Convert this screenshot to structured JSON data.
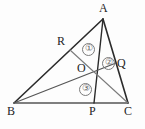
{
  "figure": {
    "type": "geometry-diagram",
    "colors": {
      "stroke_dark": "#2b2b2b",
      "stroke_mid": "#555555",
      "stroke_light": "#7b7b7b",
      "label_text": "#1d1d1d",
      "region_text": "#5f5f5f",
      "background": "#fdfdfd"
    },
    "points": {
      "A": {
        "label": "A",
        "x": 103,
        "y": 19,
        "label_x": 99,
        "label_y": 3
      },
      "B": {
        "label": "B",
        "x": 14,
        "y": 103,
        "label_x": 8,
        "label_y": 106
      },
      "C": {
        "label": "C",
        "x": 128,
        "y": 103,
        "label_x": 125,
        "label_y": 106
      },
      "O": {
        "label": "O",
        "x": 96,
        "y": 78,
        "label_x": 77,
        "label_y": 63
      },
      "P": {
        "label": "P",
        "x": 94,
        "y": 103,
        "label_x": 89,
        "label_y": 106
      },
      "Q": {
        "label": "Q",
        "x": 116,
        "y": 63,
        "label_x": 117,
        "label_y": 58
      },
      "R": {
        "label": "R",
        "x": 70,
        "y": 50,
        "label_x": 58,
        "label_y": 36
      }
    },
    "segments": [
      {
        "name": "side-AB",
        "from": "A",
        "to": "B",
        "width": 1.6,
        "shade": "stroke_dark"
      },
      {
        "name": "side-BC",
        "from": "B",
        "to": "C",
        "width": 1.6,
        "shade": "stroke_mid"
      },
      {
        "name": "side-CA",
        "from": "C",
        "to": "A",
        "width": 1.6,
        "shade": "stroke_dark"
      },
      {
        "name": "cevian-AP",
        "from": "A",
        "to": "P",
        "width": 1.4,
        "shade": "stroke_dark"
      },
      {
        "name": "cevian-BQ",
        "from": "B",
        "to": "Q",
        "width": 1.2,
        "shade": "stroke_mid"
      },
      {
        "name": "cevian-CR",
        "from": "C",
        "to": "R",
        "width": 1.1,
        "shade": "stroke_light"
      }
    ],
    "regions": [
      {
        "name": "region-1",
        "label": "①",
        "cx": 88,
        "cy": 49
      },
      {
        "name": "region-2",
        "label": "②",
        "cx": 108,
        "cy": 63
      },
      {
        "name": "region-3",
        "label": "③",
        "cx": 85,
        "cy": 89
      }
    ]
  }
}
